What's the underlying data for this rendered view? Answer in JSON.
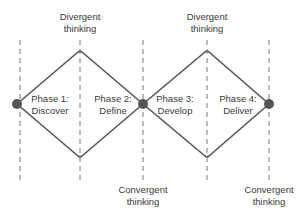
{
  "diagram": {
    "top_labels": [
      {
        "line1": "Divergent",
        "line2": "thinking"
      },
      {
        "line1": "Divergent",
        "line2": "thinking"
      }
    ],
    "bottom_labels": [
      {
        "line1": "Convergent",
        "line2": "thinking"
      },
      {
        "line1": "Convergent",
        "line2": "thinking"
      }
    ],
    "phases": [
      {
        "line1": "Phase 1:",
        "line2": "Discover"
      },
      {
        "line1": "Phase 2:",
        "line2": "Define"
      },
      {
        "line1": "Phase 3:",
        "line2": "Develop"
      },
      {
        "line1": "Phase 4:",
        "line2": "Deliver"
      }
    ],
    "colors": {
      "line": "#555555",
      "dash": "#777777",
      "text": "#3a3a3a"
    }
  }
}
